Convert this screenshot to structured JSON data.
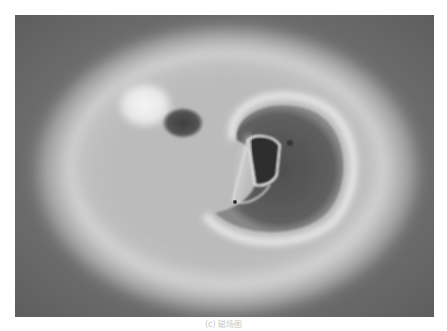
{
  "figure": {
    "colors": {
      "background": "#6e6e6e",
      "halo": "#d9d9d9",
      "dark_region": "#4a4a4a",
      "bright_spot": "#f2f2f2"
    }
  },
  "caption": {
    "text": "(c) 磁场图"
  }
}
